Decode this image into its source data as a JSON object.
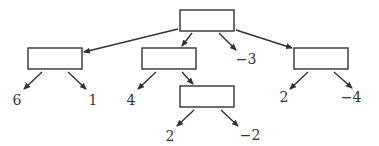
{
  "diagram": {
    "type": "tree",
    "nodes": [
      {
        "id": "root",
        "x": 180,
        "y": 10,
        "w": 54,
        "h": 21
      },
      {
        "id": "left",
        "x": 28,
        "y": 48,
        "w": 54,
        "h": 21
      },
      {
        "id": "mid",
        "x": 142,
        "y": 48,
        "w": 54,
        "h": 21
      },
      {
        "id": "right",
        "x": 294,
        "y": 48,
        "w": 54,
        "h": 21
      },
      {
        "id": "midchild",
        "x": 180,
        "y": 86,
        "w": 54,
        "h": 21
      }
    ],
    "leaves": [
      {
        "id": "l6",
        "label": "6",
        "x": 17,
        "y": 100
      },
      {
        "id": "l1",
        "label": "1",
        "x": 93,
        "y": 100
      },
      {
        "id": "l4",
        "label": "4",
        "x": 131,
        "y": 100
      },
      {
        "id": "lm3",
        "label": "−3",
        "x": 246,
        "y": 59
      },
      {
        "id": "l2a",
        "label": "2",
        "x": 170,
        "y": 136
      },
      {
        "id": "lm2",
        "label": "−2",
        "x": 250,
        "y": 135
      },
      {
        "id": "l2b",
        "label": "2",
        "x": 284,
        "y": 97
      },
      {
        "id": "lm4",
        "label": "−4",
        "x": 351,
        "y": 97
      }
    ],
    "edges": [
      {
        "x1": 178,
        "y1": 29,
        "x2": 84,
        "y2": 52
      },
      {
        "x1": 192,
        "y1": 33,
        "x2": 182,
        "y2": 46
      },
      {
        "x1": 219,
        "y1": 33,
        "x2": 236,
        "y2": 50
      },
      {
        "x1": 236,
        "y1": 30,
        "x2": 292,
        "y2": 48
      },
      {
        "x1": 42,
        "y1": 72,
        "x2": 24,
        "y2": 89
      },
      {
        "x1": 68,
        "y1": 72,
        "x2": 86,
        "y2": 89
      },
      {
        "x1": 156,
        "y1": 72,
        "x2": 138,
        "y2": 89
      },
      {
        "x1": 182,
        "y1": 72,
        "x2": 193,
        "y2": 84
      },
      {
        "x1": 194,
        "y1": 110,
        "x2": 177,
        "y2": 126
      },
      {
        "x1": 221,
        "y1": 110,
        "x2": 238,
        "y2": 126
      },
      {
        "x1": 308,
        "y1": 72,
        "x2": 290,
        "y2": 89
      },
      {
        "x1": 334,
        "y1": 72,
        "x2": 352,
        "y2": 88
      }
    ]
  }
}
